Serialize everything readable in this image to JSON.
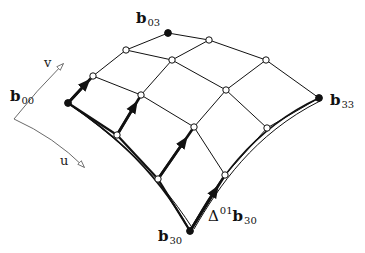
{
  "figure": {
    "colors": {
      "line": "#111111",
      "background": "#ffffff",
      "thin_line": "#444444"
    }
  },
  "axes": {
    "u_label": "u",
    "v_label": "v",
    "corner": [
      14,
      119
    ],
    "v_tip": [
      63,
      64
    ],
    "u_tip": [
      84,
      167
    ]
  },
  "control_points": [
    {
      "id": "b00",
      "x": 68,
      "y": 103,
      "filled": true
    },
    {
      "id": "b01",
      "x": 93,
      "y": 76,
      "filled": false
    },
    {
      "id": "b02",
      "x": 126,
      "y": 50,
      "filled": false
    },
    {
      "id": "b03",
      "x": 168,
      "y": 33,
      "filled": true
    },
    {
      "id": "b10",
      "x": 117,
      "y": 135,
      "filled": false
    },
    {
      "id": "b11",
      "x": 141,
      "y": 95,
      "filled": false
    },
    {
      "id": "b12",
      "x": 172,
      "y": 60,
      "filled": false
    },
    {
      "id": "b13",
      "x": 209,
      "y": 40,
      "filled": false
    },
    {
      "id": "b20",
      "x": 158,
      "y": 179,
      "filled": false
    },
    {
      "id": "b21",
      "x": 194,
      "y": 127,
      "filled": false
    },
    {
      "id": "b22",
      "x": 226,
      "y": 90,
      "filled": false
    },
    {
      "id": "b23",
      "x": 266,
      "y": 60,
      "filled": false
    },
    {
      "id": "b30",
      "x": 190,
      "y": 231,
      "filled": true
    },
    {
      "id": "b31",
      "x": 225,
      "y": 175,
      "filled": false
    },
    {
      "id": "b32",
      "x": 267,
      "y": 128,
      "filled": false
    },
    {
      "id": "b33",
      "x": 319,
      "y": 98,
      "filled": true
    }
  ],
  "derivative_vectors": [
    {
      "from": "b00",
      "to": "b01"
    },
    {
      "from": "b10",
      "to": "b11"
    },
    {
      "from": "b20",
      "to": "b21"
    },
    {
      "from": "b30",
      "to": "b31"
    }
  ],
  "boundary_curves": [
    {
      "name": "u-boundary-v0",
      "path": "M68,103 C100,125 150,160 190,231",
      "offset": "M72,106 C104,129 152,165 193,229"
    },
    {
      "name": "v-boundary-u3",
      "path": "M190,231 C215,185 250,130 319,98",
      "offset": "M194,229 C219,186 254,134 320,101"
    }
  ],
  "labels": {
    "b00": {
      "base": "b",
      "sub": "00",
      "x": 10,
      "y": 88
    },
    "b03": {
      "base": "b",
      "sub": "03",
      "x": 136,
      "y": 10
    },
    "b33": {
      "base": "b",
      "sub": "33",
      "x": 330,
      "y": 92
    },
    "b30": {
      "base": "b",
      "sub": "30",
      "x": 158,
      "y": 228
    },
    "delta": {
      "prefix": "Δ",
      "sup": "01",
      "base": "b",
      "sub": "30",
      "x": 208,
      "y": 206
    }
  }
}
